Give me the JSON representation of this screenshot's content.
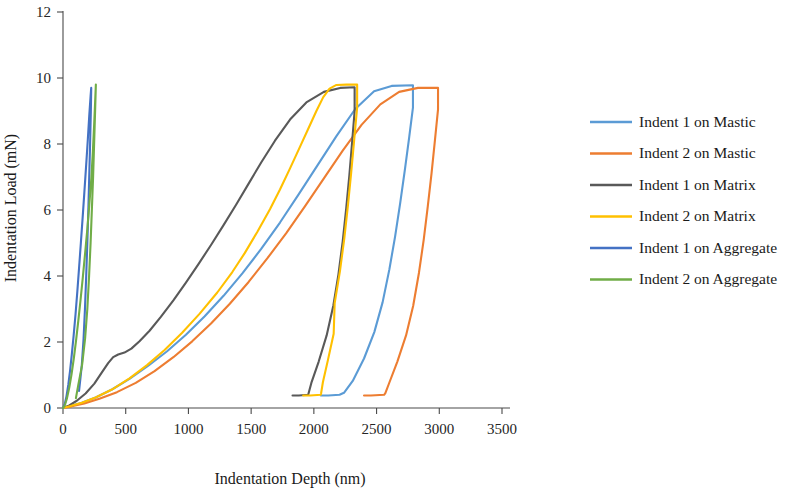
{
  "chart_data": {
    "type": "line",
    "title": "",
    "xlabel": "Indentation Depth (nm)",
    "ylabel": "Indentation Load (mN)",
    "xlim": [
      0,
      3500
    ],
    "ylim": [
      0,
      12
    ],
    "xticks": [
      0,
      500,
      1000,
      1500,
      2000,
      2500,
      3000,
      3500
    ],
    "yticks": [
      0,
      2,
      4,
      6,
      8,
      10,
      12
    ],
    "xtick_labels": [
      "0",
      "500",
      "1000",
      "1500",
      "2000",
      "2500",
      "3000",
      "3500"
    ],
    "ytick_labels": [
      "0",
      "2",
      "4",
      "6",
      "8",
      "10",
      "12"
    ],
    "grid": false,
    "legend_position": "right",
    "annotations": [],
    "series": [
      {
        "name": "Indent 1 on Mastic",
        "color": "#5B9BD5",
        "peak_load": 9.78,
        "peak_depth": 2790,
        "residual_depth": 2205,
        "points": [
          [
            0,
            0.0
          ],
          [
            60,
            0.06
          ],
          [
            150,
            0.16
          ],
          [
            260,
            0.32
          ],
          [
            390,
            0.56
          ],
          [
            530,
            0.88
          ],
          [
            680,
            1.28
          ],
          [
            830,
            1.72
          ],
          [
            980,
            2.22
          ],
          [
            1130,
            2.78
          ],
          [
            1280,
            3.4
          ],
          [
            1430,
            4.08
          ],
          [
            1580,
            4.82
          ],
          [
            1730,
            5.62
          ],
          [
            1880,
            6.48
          ],
          [
            2030,
            7.36
          ],
          [
            2180,
            8.24
          ],
          [
            2330,
            9.06
          ],
          [
            2480,
            9.6
          ],
          [
            2620,
            9.76
          ],
          [
            2790,
            9.78
          ],
          [
            2790,
            9.1
          ],
          [
            2760,
            8.2
          ],
          [
            2725,
            7.2
          ],
          [
            2688,
            6.2
          ],
          [
            2648,
            5.2
          ],
          [
            2602,
            4.2
          ],
          [
            2548,
            3.2
          ],
          [
            2482,
            2.3
          ],
          [
            2400,
            1.5
          ],
          [
            2310,
            0.82
          ],
          [
            2240,
            0.46
          ],
          [
            2205,
            0.4
          ],
          [
            2115,
            0.38
          ],
          [
            2055,
            0.38
          ]
        ]
      },
      {
        "name": "Indent 2 on Mastic",
        "color": "#ED7D31",
        "peak_load": 9.7,
        "peak_depth": 2990,
        "residual_depth": 2560,
        "points": [
          [
            0,
            0.0
          ],
          [
            70,
            0.05
          ],
          [
            170,
            0.14
          ],
          [
            290,
            0.28
          ],
          [
            430,
            0.48
          ],
          [
            580,
            0.76
          ],
          [
            730,
            1.12
          ],
          [
            880,
            1.54
          ],
          [
            1030,
            2.02
          ],
          [
            1180,
            2.56
          ],
          [
            1330,
            3.16
          ],
          [
            1480,
            3.82
          ],
          [
            1630,
            4.54
          ],
          [
            1780,
            5.3
          ],
          [
            1930,
            6.12
          ],
          [
            2080,
            6.96
          ],
          [
            2230,
            7.8
          ],
          [
            2380,
            8.58
          ],
          [
            2530,
            9.2
          ],
          [
            2680,
            9.58
          ],
          [
            2830,
            9.7
          ],
          [
            2990,
            9.7
          ],
          [
            2990,
            9.05
          ],
          [
            2965,
            8.1
          ],
          [
            2938,
            7.1
          ],
          [
            2908,
            6.1
          ],
          [
            2876,
            5.1
          ],
          [
            2838,
            4.1
          ],
          [
            2792,
            3.1
          ],
          [
            2735,
            2.2
          ],
          [
            2665,
            1.4
          ],
          [
            2600,
            0.75
          ],
          [
            2570,
            0.45
          ],
          [
            2560,
            0.4
          ],
          [
            2455,
            0.38
          ],
          [
            2400,
            0.38
          ]
        ]
      },
      {
        "name": "Indent 1 on Matrix",
        "color": "#595959",
        "peak_load": 9.72,
        "peak_depth": 2325,
        "residual_depth": 1955,
        "points": [
          [
            0,
            0.0
          ],
          [
            50,
            0.08
          ],
          [
            110,
            0.22
          ],
          [
            180,
            0.44
          ],
          [
            250,
            0.74
          ],
          [
            310,
            1.08
          ],
          [
            360,
            1.36
          ],
          [
            400,
            1.54
          ],
          [
            440,
            1.62
          ],
          [
            490,
            1.68
          ],
          [
            545,
            1.8
          ],
          [
            610,
            2.02
          ],
          [
            690,
            2.34
          ],
          [
            780,
            2.76
          ],
          [
            880,
            3.26
          ],
          [
            980,
            3.8
          ],
          [
            1080,
            4.36
          ],
          [
            1180,
            4.94
          ],
          [
            1280,
            5.54
          ],
          [
            1380,
            6.16
          ],
          [
            1480,
            6.8
          ],
          [
            1580,
            7.44
          ],
          [
            1690,
            8.1
          ],
          [
            1810,
            8.74
          ],
          [
            1940,
            9.26
          ],
          [
            2080,
            9.58
          ],
          [
            2210,
            9.7
          ],
          [
            2325,
            9.72
          ],
          [
            2325,
            9.0
          ],
          [
            2305,
            8.05
          ],
          [
            2283,
            7.05
          ],
          [
            2258,
            6.05
          ],
          [
            2230,
            5.05
          ],
          [
            2196,
            4.05
          ],
          [
            2155,
            3.1
          ],
          [
            2102,
            2.2
          ],
          [
            2038,
            1.4
          ],
          [
            1980,
            0.76
          ],
          [
            1958,
            0.45
          ],
          [
            1955,
            0.4
          ],
          [
            1880,
            0.38
          ],
          [
            1830,
            0.38
          ]
        ]
      },
      {
        "name": "Indent 2 on Matrix",
        "color": "#FFC000",
        "peak_load": 9.8,
        "peak_depth": 2345,
        "residual_depth": 2055,
        "points": [
          [
            0,
            0.0
          ],
          [
            60,
            0.06
          ],
          [
            150,
            0.16
          ],
          [
            260,
            0.32
          ],
          [
            390,
            0.56
          ],
          [
            530,
            0.9
          ],
          [
            670,
            1.3
          ],
          [
            810,
            1.76
          ],
          [
            950,
            2.28
          ],
          [
            1090,
            2.86
          ],
          [
            1230,
            3.5
          ],
          [
            1350,
            4.12
          ],
          [
            1450,
            4.7
          ],
          [
            1550,
            5.34
          ],
          [
            1650,
            6.02
          ],
          [
            1730,
            6.62
          ],
          [
            1810,
            7.26
          ],
          [
            1890,
            7.92
          ],
          [
            1960,
            8.5
          ],
          [
            2020,
            9.0
          ],
          [
            2075,
            9.42
          ],
          [
            2125,
            9.68
          ],
          [
            2180,
            9.79
          ],
          [
            2260,
            9.8
          ],
          [
            2345,
            9.8
          ],
          [
            2345,
            9.1
          ],
          [
            2322,
            8.15
          ],
          [
            2298,
            7.15
          ],
          [
            2272,
            6.15
          ],
          [
            2243,
            5.15
          ],
          [
            2208,
            4.15
          ],
          [
            2166,
            3.18
          ],
          [
            2158,
            2.25
          ],
          [
            2112,
            1.45
          ],
          [
            2072,
            0.78
          ],
          [
            2058,
            0.45
          ],
          [
            2055,
            0.4
          ],
          [
            1970,
            0.38
          ],
          [
            1915,
            0.38
          ]
        ]
      },
      {
        "name": "Indent 1 on Aggregate",
        "color": "#4472C4",
        "peak_load": 9.7,
        "peak_depth": 225,
        "residual_depth": 128,
        "points": [
          [
            0,
            0.0
          ],
          [
            14,
            0.12
          ],
          [
            28,
            0.36
          ],
          [
            42,
            0.7
          ],
          [
            56,
            1.12
          ],
          [
            70,
            1.62
          ],
          [
            85,
            2.2
          ],
          [
            100,
            2.84
          ],
          [
            114,
            3.52
          ],
          [
            128,
            4.24
          ],
          [
            142,
            4.98
          ],
          [
            156,
            5.74
          ],
          [
            170,
            6.52
          ],
          [
            184,
            7.32
          ],
          [
            198,
            8.14
          ],
          [
            210,
            8.9
          ],
          [
            220,
            9.45
          ],
          [
            225,
            9.7
          ],
          [
            222,
            9.0
          ],
          [
            216,
            8.0
          ],
          [
            209,
            7.0
          ],
          [
            202,
            6.0
          ],
          [
            194,
            5.0
          ],
          [
            185,
            4.0
          ],
          [
            175,
            3.0
          ],
          [
            164,
            2.1
          ],
          [
            150,
            1.3
          ],
          [
            136,
            0.8
          ],
          [
            128,
            0.52
          ]
        ]
      },
      {
        "name": "Indent 2 on Aggregate",
        "color": "#70AD47",
        "peak_load": 9.8,
        "peak_depth": 262,
        "residual_depth": 103,
        "points": [
          [
            0,
            0.0
          ],
          [
            16,
            0.1
          ],
          [
            32,
            0.3
          ],
          [
            50,
            0.62
          ],
          [
            68,
            1.02
          ],
          [
            86,
            1.5
          ],
          [
            104,
            2.04
          ],
          [
            122,
            2.64
          ],
          [
            140,
            3.28
          ],
          [
            158,
            3.96
          ],
          [
            176,
            4.68
          ],
          [
            194,
            5.42
          ],
          [
            210,
            6.18
          ],
          [
            226,
            6.96
          ],
          [
            238,
            7.76
          ],
          [
            248,
            8.56
          ],
          [
            256,
            9.26
          ],
          [
            262,
            9.8
          ],
          [
            256,
            9.0
          ],
          [
            248,
            8.0
          ],
          [
            240,
            7.0
          ],
          [
            230,
            6.0
          ],
          [
            220,
            5.0
          ],
          [
            208,
            4.0
          ],
          [
            194,
            3.0
          ],
          [
            176,
            2.1
          ],
          [
            152,
            1.3
          ],
          [
            122,
            0.7
          ],
          [
            103,
            0.3
          ]
        ]
      }
    ]
  },
  "legend": {
    "items": [
      {
        "label": "Indent 1 on Mastic",
        "color": "#5B9BD5"
      },
      {
        "label": "Indent 2 on Mastic",
        "color": "#ED7D31"
      },
      {
        "label": "Indent 1 on Matrix",
        "color": "#595959"
      },
      {
        "label": "Indent 2 on Matrix",
        "color": "#FFC000"
      },
      {
        "label": "Indent 1 on Aggregate",
        "color": "#4472C4"
      },
      {
        "label": "Indent 2 on Aggregate",
        "color": "#70AD47"
      }
    ]
  }
}
